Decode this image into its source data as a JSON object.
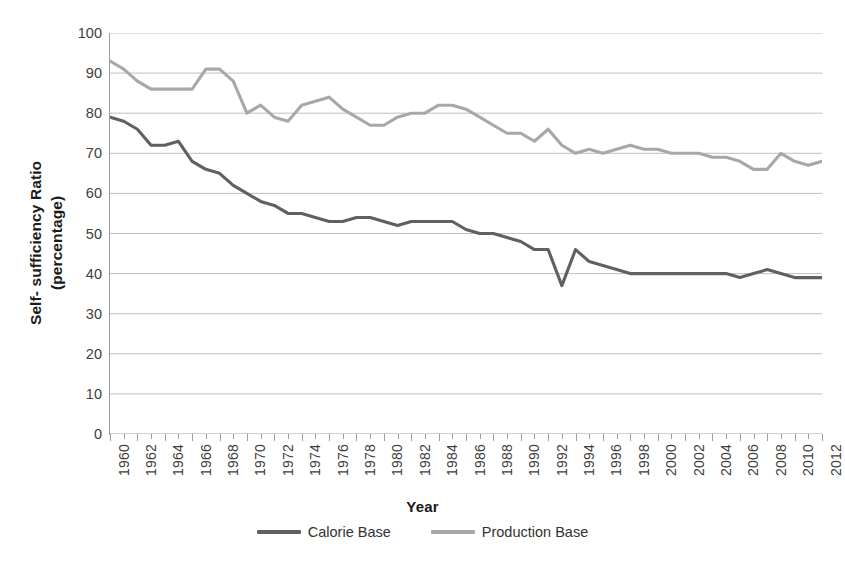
{
  "chart_data": {
    "type": "line",
    "title": "",
    "xlabel": "Year",
    "ylabel": "Self- sufficiency Ratio (percentage)",
    "ylabel_line1": "Self- sufficiency Ratio",
    "ylabel_line2": "(percentage)",
    "xlim": [
      1960,
      2012
    ],
    "ylim": [
      0,
      100
    ],
    "y_ticks": [
      0,
      10,
      20,
      30,
      40,
      50,
      60,
      70,
      80,
      90,
      100
    ],
    "grid": "horizontal",
    "legend_position": "bottom",
    "x": [
      1960,
      1961,
      1962,
      1963,
      1964,
      1965,
      1966,
      1967,
      1968,
      1969,
      1970,
      1971,
      1972,
      1973,
      1974,
      1975,
      1976,
      1977,
      1978,
      1979,
      1980,
      1981,
      1982,
      1983,
      1984,
      1985,
      1986,
      1987,
      1988,
      1989,
      1990,
      1991,
      1992,
      1993,
      1994,
      1995,
      1996,
      1997,
      1998,
      1999,
      2000,
      2001,
      2002,
      2003,
      2004,
      2005,
      2006,
      2007,
      2008,
      2009,
      2010,
      2011,
      2012
    ],
    "x_tick_labels": [
      "1960",
      "1962",
      "1964",
      "1966",
      "1968",
      "1970",
      "1972",
      "1974",
      "1976",
      "1978",
      "1980",
      "1982",
      "1984",
      "1986",
      "1988",
      "1990",
      "1992",
      "1994",
      "1996",
      "1998",
      "2000",
      "2002",
      "2004",
      "2006",
      "2008",
      "2010",
      "2012"
    ],
    "series": [
      {
        "name": "Calorie Base",
        "color": "#606060",
        "values": [
          79,
          78,
          76,
          72,
          72,
          73,
          68,
          66,
          65,
          62,
          60,
          58,
          57,
          55,
          55,
          54,
          53,
          53,
          54,
          54,
          53,
          52,
          53,
          53,
          53,
          53,
          51,
          50,
          50,
          49,
          48,
          46,
          46,
          37,
          46,
          43,
          42,
          41,
          40,
          40,
          40,
          40,
          40,
          40,
          40,
          40,
          39,
          40,
          41,
          40,
          39,
          39,
          39
        ]
      },
      {
        "name": "Production Base",
        "color": "#a8a8a8",
        "values": [
          93,
          91,
          88,
          86,
          86,
          86,
          86,
          91,
          91,
          88,
          80,
          82,
          79,
          78,
          82,
          83,
          84,
          81,
          79,
          77,
          77,
          79,
          80,
          80,
          82,
          82,
          81,
          79,
          77,
          75,
          75,
          73,
          76,
          72,
          70,
          71,
          70,
          71,
          72,
          71,
          71,
          70,
          70,
          70,
          69,
          69,
          68,
          66,
          66,
          70,
          68,
          67,
          68
        ]
      }
    ]
  },
  "axes": {
    "x_axis_label": "Year",
    "y_axis_label_line1": "Self- sufficiency Ratio",
    "y_axis_label_line2": "(percentage)"
  },
  "legend": {
    "items": [
      {
        "label": "Calorie Base",
        "color": "#606060"
      },
      {
        "label": "Production Base",
        "color": "#a8a8a8"
      }
    ]
  }
}
